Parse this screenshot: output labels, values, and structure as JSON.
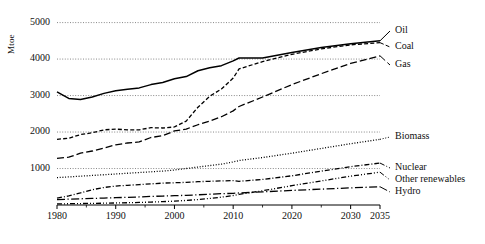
{
  "chart_data": {
    "type": "line",
    "title": "",
    "xlabel": "",
    "ylabel": "Mtoe",
    "xlim": [
      1980,
      2035
    ],
    "ylim": [
      0,
      5400
    ],
    "grid": true,
    "gridlines": [
      1000,
      2000,
      3000,
      4000,
      5000
    ],
    "legend_position": "right-inline",
    "xticks": [
      "1980",
      "1990",
      "2000",
      "2010",
      "2020",
      "2030",
      "2035"
    ],
    "xtick_values": [
      1980,
      1990,
      2000,
      2010,
      2020,
      2030,
      2035
    ],
    "yticks": [
      "1000",
      "2000",
      "3000",
      "4000",
      "5000"
    ],
    "ytick_values": [
      1000,
      2000,
      3000,
      4000,
      5000
    ],
    "x": [
      1980,
      1982,
      1984,
      1986,
      1988,
      1990,
      1992,
      1994,
      1996,
      1998,
      2000,
      2002,
      2004,
      2006,
      2008,
      2010,
      2011,
      2015,
      2020,
      2025,
      2030,
      2035
    ],
    "series": [
      {
        "name": "Oil",
        "style": "solid",
        "label_y_px": 31,
        "values": [
          3100,
          2920,
          2890,
          2960,
          3060,
          3130,
          3170,
          3210,
          3300,
          3360,
          3460,
          3520,
          3680,
          3760,
          3820,
          3950,
          4030,
          4030,
          4180,
          4320,
          4420,
          4500
        ]
      },
      {
        "name": "Coal",
        "style": "dashed",
        "label_y_px": 47,
        "values": [
          1800,
          1830,
          1930,
          1980,
          2060,
          2080,
          2060,
          2060,
          2120,
          2110,
          2140,
          2300,
          2680,
          2980,
          3180,
          3480,
          3730,
          3930,
          4130,
          4280,
          4390,
          4450
        ]
      },
      {
        "name": "Gas",
        "style": "long-dash",
        "label_y_px": 65,
        "values": [
          1280,
          1310,
          1420,
          1480,
          1560,
          1650,
          1700,
          1730,
          1850,
          1900,
          2030,
          2080,
          2200,
          2300,
          2420,
          2580,
          2700,
          2960,
          3300,
          3600,
          3880,
          4090
        ]
      },
      {
        "name": "Biomass",
        "style": "dotted",
        "label_y_px": 137,
        "values": [
          750,
          770,
          790,
          810,
          830,
          850,
          870,
          890,
          910,
          930,
          960,
          1000,
          1040,
          1080,
          1120,
          1180,
          1220,
          1300,
          1420,
          1550,
          1680,
          1800
        ]
      },
      {
        "name": "Nuclear",
        "style": "dash-dot",
        "label_y_px": 168,
        "values": [
          190,
          250,
          330,
          420,
          480,
          520,
          540,
          560,
          580,
          600,
          610,
          620,
          640,
          650,
          660,
          670,
          650,
          700,
          800,
          930,
          1050,
          1150
        ]
      },
      {
        "name": "Other renewables",
        "style": "dash-dot-dot",
        "label_y_px": 180,
        "values": [
          30,
          35,
          40,
          45,
          50,
          55,
          62,
          70,
          80,
          92,
          105,
          125,
          150,
          180,
          215,
          260,
          290,
          390,
          530,
          660,
          790,
          900
        ]
      },
      {
        "name": "Hydro",
        "style": "long-dash-dot",
        "label_y_px": 192,
        "values": [
          150,
          160,
          170,
          180,
          190,
          200,
          210,
          220,
          235,
          245,
          255,
          265,
          280,
          295,
          310,
          320,
          330,
          360,
          400,
          435,
          470,
          500
        ]
      }
    ]
  },
  "axes": {
    "y_axis_label": "Mtoe"
  }
}
